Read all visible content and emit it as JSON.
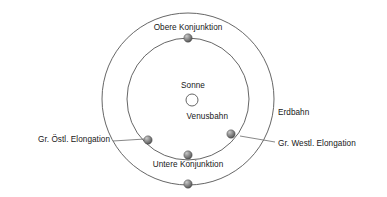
{
  "diagram": {
    "background_color": "#ffffff",
    "orbit_stroke_color": "#555555",
    "leader_line_color": "#666666",
    "text_color": "#171717",
    "sun": {
      "label": "Sonne",
      "fill": "#ffffff",
      "stroke": "#555555",
      "cx": 192,
      "cy": 100,
      "r": 6
    },
    "orbits": [
      {
        "name": "Erdbahn",
        "label": "Erdbahn",
        "cx": 188,
        "cy": 99,
        "r": 86
      },
      {
        "name": "Venusbahn",
        "label": "Venusbahn",
        "cx": 188,
        "cy": 99,
        "r": 61
      }
    ],
    "bodies": [
      {
        "name": "obere-konjunktion-marker",
        "label": "Obere Konjunktion",
        "cx": 188,
        "cy": 38,
        "r": 4,
        "orbit": "Venusbahn"
      },
      {
        "name": "gr-oestl-elongation-marker",
        "label": "Gr. Östl. Elongation",
        "cx": 148,
        "cy": 140,
        "r": 4,
        "orbit": "Venusbahn"
      },
      {
        "name": "gr-westl-elongation-marker",
        "label": "Gr. Westl. Elongation",
        "cx": 231,
        "cy": 134,
        "r": 4,
        "orbit": "Venusbahn"
      },
      {
        "name": "untere-konjunktion-marker",
        "label": "Untere Konjunktion",
        "cx": 188,
        "cy": 155,
        "r": 4,
        "orbit": "Venusbahn"
      },
      {
        "name": "erde-marker",
        "label": "",
        "cx": 188,
        "cy": 184,
        "r": 4,
        "orbit": "Erdbahn"
      }
    ],
    "labels": {
      "obere_konjunktion": "Obere Konjunktion",
      "sonne": "Sonne",
      "venusbahn": "Venusbahn",
      "erdbahn": "Erdbahn",
      "gr_oestl_elongation": "Gr. Östl. Elongation",
      "gr_westl_elongation": "Gr. Westl. Elongation",
      "untere_konjunktion": "Untere Konjunktion"
    },
    "leader_lines": [
      {
        "name": "leader-gr-oestl",
        "x1": 113,
        "y1": 141,
        "x2": 145,
        "y2": 139
      },
      {
        "name": "leader-gr-westl",
        "x1": 240,
        "y1": 136,
        "x2": 275,
        "y2": 142
      }
    ]
  }
}
